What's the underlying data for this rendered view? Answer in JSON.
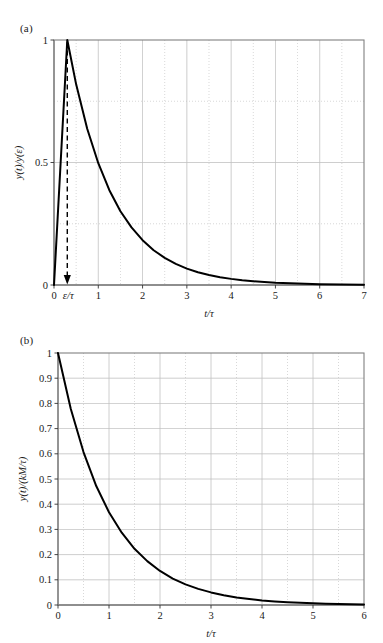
{
  "figure": {
    "background_color": "#ffffff",
    "curve_color": "#000000",
    "grid_color": "#bfbfbf",
    "frame_color": "#808080",
    "annotation_color": "#000000"
  },
  "panels": [
    {
      "tag": "(a)",
      "xlabel": "t/τ",
      "ylabel": "y(t)/y(ε)",
      "annotation_label": "ε/τ"
    },
    {
      "tag": "(b)",
      "xlabel": "t/τ",
      "ylabel": "y(t)/(kM/τ)"
    }
  ],
  "chart_data": [
    {
      "type": "line",
      "title": "(a)",
      "xlabel": "t/τ",
      "ylabel": "y(t)/y(ε)",
      "xlim": [
        0,
        7
      ],
      "ylim": [
        0,
        1
      ],
      "xticks": [
        0,
        1,
        2,
        3,
        4,
        5,
        6,
        7
      ],
      "xticklabels": [
        "0",
        "1",
        "2",
        "3",
        "4",
        "5",
        "6",
        "7"
      ],
      "yticks": [
        0,
        0.5,
        1
      ],
      "yticklabels": [
        "0",
        "0.5",
        "1"
      ],
      "minor_xgrid": [
        0.5,
        1.5,
        2.5,
        3.5,
        4.5,
        5.5,
        6.5
      ],
      "minor_ygrid": [
        0.25,
        0.75
      ],
      "grid": true,
      "legend": "none",
      "annotations": [
        {
          "type": "dashed-arrow",
          "label": "ε/τ",
          "from": [
            0.3,
            1.0
          ],
          "to": [
            0.3,
            0.0
          ],
          "label_position": "x-axis-tick"
        }
      ],
      "series": [
        {
          "name": "impulse response",
          "description": "Sharp linear rise from 0 to peak 1 at t/τ = 0.3, then exponential decay exp(-(t-0.3)/τ)",
          "x": [
            0,
            0.3,
            0.5,
            0.75,
            1.0,
            1.25,
            1.5,
            1.75,
            2.0,
            2.25,
            2.5,
            2.75,
            3.0,
            3.25,
            3.5,
            3.75,
            4.0,
            4.25,
            4.5,
            4.75,
            5.0,
            5.5,
            6.0,
            6.5,
            7.0
          ],
          "y": [
            0,
            1.0,
            0.819,
            0.638,
            0.497,
            0.387,
            0.301,
            0.235,
            0.183,
            0.142,
            0.111,
            0.086,
            0.067,
            0.052,
            0.041,
            0.032,
            0.025,
            0.019,
            0.015,
            0.012,
            0.009,
            0.006,
            0.003,
            0.002,
            0.001
          ]
        }
      ]
    },
    {
      "type": "line",
      "title": "(b)",
      "xlabel": "t/τ",
      "ylabel": "y(t)/(kM/τ)",
      "xlim": [
        0,
        6
      ],
      "ylim": [
        0,
        1
      ],
      "xticks": [
        0,
        1,
        2,
        3,
        4,
        5,
        6
      ],
      "xticklabels": [
        "0",
        "1",
        "2",
        "3",
        "4",
        "5",
        "6"
      ],
      "yticks": [
        0,
        0.1,
        0.2,
        0.3,
        0.4,
        0.5,
        0.6,
        0.7,
        0.8,
        0.9,
        1
      ],
      "yticklabels": [
        "0",
        "0.1",
        "0.2",
        "0.3",
        "0.4",
        "0.5",
        "0.6",
        "0.7",
        "0.8",
        "0.9",
        "1"
      ],
      "minor_xgrid": [
        0.5,
        1.5,
        2.5,
        3.5,
        4.5,
        5.5
      ],
      "grid": true,
      "legend": "none",
      "series": [
        {
          "name": "exponential decay",
          "description": "y = exp(-t/τ)",
          "x": [
            0,
            0.25,
            0.5,
            0.75,
            1.0,
            1.25,
            1.5,
            1.75,
            2.0,
            2.25,
            2.5,
            2.75,
            3.0,
            3.25,
            3.5,
            3.75,
            4.0,
            4.25,
            4.5,
            4.75,
            5.0,
            5.25,
            5.5,
            5.75,
            6.0
          ],
          "y": [
            1.0,
            0.779,
            0.607,
            0.472,
            0.368,
            0.287,
            0.223,
            0.174,
            0.135,
            0.105,
            0.082,
            0.064,
            0.05,
            0.039,
            0.03,
            0.024,
            0.018,
            0.014,
            0.011,
            0.009,
            0.007,
            0.005,
            0.004,
            0.003,
            0.002
          ]
        }
      ]
    }
  ]
}
